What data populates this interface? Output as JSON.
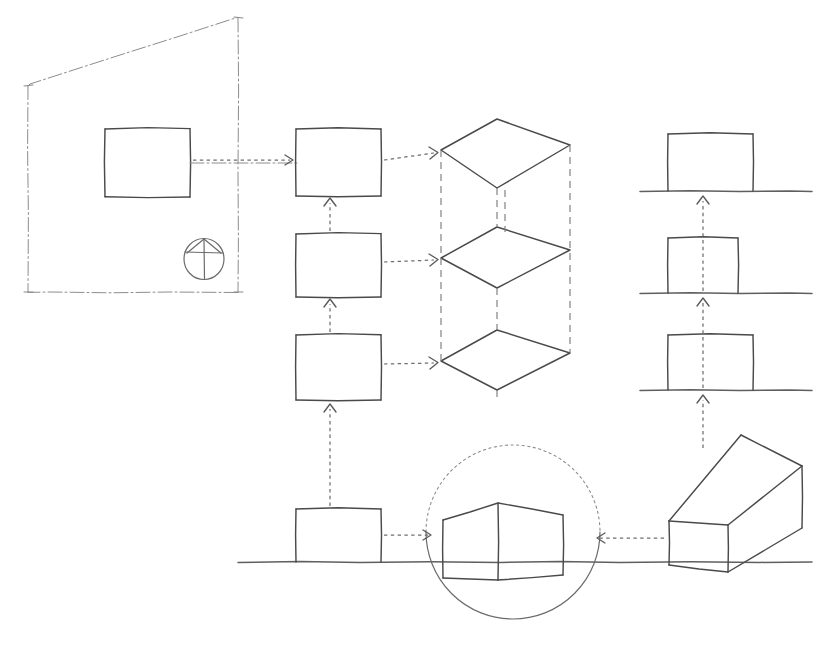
{
  "drawing": {
    "title": "Hand-drawn projection and extrusion sketch",
    "medium": "pencil sketch",
    "background_color": "#ffffff",
    "ink_color": "#4a4a4a",
    "light_ink_color": "#8d8d8d",
    "width": 825,
    "height": 658
  },
  "groups": [
    {
      "id": "drawing-frame",
      "label": "Perspective sheet border",
      "line_style": "dash-dot",
      "shape": "trapezoid",
      "points": "28,85 238,17 238,292 28,292"
    },
    {
      "id": "projection-symbol",
      "label": "Projection symbol",
      "line_style": "solid",
      "shape": "circle-with-peak",
      "center_x": 204,
      "center_y": 259,
      "radius": 20
    },
    {
      "id": "source-rectangle",
      "label": "Source face rectangle",
      "line_style": "solid",
      "x": 105,
      "y": 128,
      "w": 85,
      "h": 69
    },
    {
      "id": "face-column",
      "label": "Stacked face rectangles",
      "line_style": "solid",
      "x": 296,
      "w": 85,
      "rows": [
        {
          "y": 128,
          "h": 68
        },
        {
          "y": 233,
          "h": 64
        },
        {
          "y": 334,
          "h": 66
        }
      ]
    },
    {
      "id": "iso-stack",
      "label": "Isometric extrusion stack",
      "line_style": "solid-with-hidden-dashes",
      "levels": [
        {
          "left_x": 441,
          "left_y": 150,
          "top_x": 497,
          "top_y": 119,
          "right_x": 570,
          "right_y": 145,
          "bottom_x": 497,
          "bottom_y": 188
        },
        {
          "left_x": 441,
          "left_y": 258,
          "top_x": 497,
          "top_y": 227,
          "right_x": 570,
          "right_y": 250,
          "bottom_x": 497,
          "bottom_y": 288
        },
        {
          "left_x": 441,
          "left_y": 361,
          "top_x": 497,
          "top_y": 330,
          "right_x": 570,
          "right_y": 353,
          "bottom_x": 497,
          "bottom_y": 390
        }
      ],
      "hidden_verticals_x": [
        441,
        497,
        570
      ]
    },
    {
      "id": "elevation-column",
      "label": "Elevation views on ground lines",
      "line_style": "solid",
      "rows": [
        {
          "x": 668,
          "y": 133,
          "w": 85,
          "h": 58,
          "ground_y": 191,
          "ground_x1": 640,
          "ground_x2": 812
        },
        {
          "x": 668,
          "y": 237,
          "w": 70,
          "h": 56,
          "ground_y": 293,
          "ground_x1": 640,
          "ground_x2": 812
        },
        {
          "x": 668,
          "y": 334,
          "w": 85,
          "h": 56,
          "ground_y": 390,
          "ground_x1": 640,
          "ground_x2": 812
        }
      ]
    },
    {
      "id": "baseline-rectangle",
      "label": "Baseline plan rectangle",
      "line_style": "solid",
      "x": 296,
      "y": 508,
      "w": 85,
      "h": 54
    },
    {
      "id": "detail-circle",
      "label": "Detail callout circle",
      "line_style": "dotted-top-solid-bottom",
      "center_x": 513,
      "center_y": 532,
      "radius": 87
    },
    {
      "id": "two-face-block",
      "label": "Two-face front view block",
      "line_style": "solid",
      "points": "443,519 498,503 563,515 563,575 498,580 443,578"
    },
    {
      "id": "iso-cube",
      "label": "Isometric cube solid",
      "line_style": "solid",
      "front_face": "669,521 669,565 728,572 728,525",
      "top_face": "669,521 741,435 802,466 728,525",
      "right_face": "728,525 802,466 802,528 728,572"
    },
    {
      "id": "base-ground-line",
      "label": "Main ground line",
      "line_style": "solid",
      "y": 562,
      "x1": 238,
      "x2": 812
    }
  ],
  "connectors": [
    {
      "id": "conn-1",
      "label": "Source rectangle to stack top face",
      "from_x": 192,
      "from_y": 160,
      "to_x": 292,
      "to_y": 160,
      "direction": "right",
      "style": "dashed-arrow"
    },
    {
      "id": "conn-2",
      "label": "Stack face 1 to isometric level 1",
      "from_x": 383,
      "from_y": 160,
      "to_x": 437,
      "to_y": 152,
      "direction": "right",
      "style": "dashed-arrow"
    },
    {
      "id": "conn-3",
      "label": "Stack face 2 to isometric level 2",
      "from_x": 383,
      "from_y": 262,
      "to_x": 437,
      "to_y": 259,
      "direction": "right",
      "style": "dashed-arrow"
    },
    {
      "id": "conn-4",
      "label": "Stack face 3 to isometric level 3",
      "from_x": 383,
      "from_y": 364,
      "to_x": 437,
      "to_y": 362,
      "direction": "right",
      "style": "dashed-arrow"
    },
    {
      "id": "conn-5",
      "label": "Stack face 2 up to face 1",
      "from_x": 330,
      "from_y": 231,
      "to_x": 330,
      "to_y": 200,
      "direction": "up",
      "style": "dashed-arrow"
    },
    {
      "id": "conn-6",
      "label": "Stack face 3 up to face 2",
      "from_x": 330,
      "from_y": 332,
      "to_x": 330,
      "to_y": 301,
      "direction": "up",
      "style": "dashed-arrow"
    },
    {
      "id": "conn-7",
      "label": "Baseline rectangle up to stack face 3",
      "from_x": 330,
      "from_y": 506,
      "to_x": 330,
      "to_y": 404,
      "direction": "up",
      "style": "dashed-arrow"
    },
    {
      "id": "conn-8",
      "label": "Elevation 2 up to elevation 1",
      "from_x": 703,
      "from_y": 291,
      "to_x": 703,
      "to_y": 196,
      "direction": "up",
      "style": "dashed-arrow"
    },
    {
      "id": "conn-9",
      "label": "Elevation 3 up to elevation 2",
      "from_x": 703,
      "from_y": 388,
      "to_x": 703,
      "to_y": 298,
      "direction": "up",
      "style": "dashed-arrow"
    },
    {
      "id": "conn-10",
      "label": "Isometric cube up to elevation 3",
      "from_x": 703,
      "from_y": 440,
      "to_x": 703,
      "to_y": 395,
      "direction": "up",
      "style": "dashed-arrow"
    },
    {
      "id": "conn-11",
      "label": "Baseline rectangle to detail circle",
      "from_x": 383,
      "from_y": 535,
      "to_x": 432,
      "to_y": 535,
      "direction": "right",
      "style": "dashed-arrow"
    },
    {
      "id": "conn-12",
      "label": "Isometric cube to detail circle",
      "from_x": 664,
      "from_y": 538,
      "to_x": 596,
      "to_y": 538,
      "direction": "left",
      "style": "dashed-arrow"
    },
    {
      "id": "conn-13",
      "label": "Frame centre line horizontal",
      "from_x": 190,
      "from_y": 163,
      "to_x": 300,
      "to_y": 163,
      "direction": "right",
      "style": "dash-dot"
    }
  ]
}
